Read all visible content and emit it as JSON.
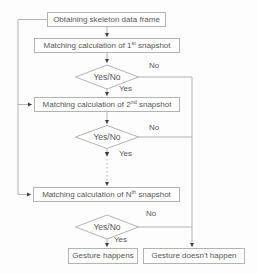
{
  "flowchart": {
    "nodes": {
      "start": {
        "label": "Obtaining skeleton data frame"
      },
      "match_1": {
        "text_before": "Matching calculation of 1",
        "superscript": "st",
        "text_after": " snapshot"
      },
      "decision_1": {
        "label": "Yes/No"
      },
      "match_2": {
        "text_before": "Matching calculation of 2",
        "superscript": "nd",
        "text_after": " snapshot"
      },
      "decision_2": {
        "label": "Yes/No"
      },
      "match_n": {
        "text_before": "Matching calculation of N",
        "superscript": "th",
        "text_after": " snapshot"
      },
      "decision_3": {
        "label": "Yes/No"
      },
      "gesture_happens": {
        "label": "Gesture happens"
      },
      "gesture_doesnt_happen": {
        "label": "Gesture doesn't happen"
      }
    },
    "edge_labels": {
      "decision_1_yes": "Yes",
      "decision_1_no": "No",
      "decision_2_yes": "Yes",
      "decision_2_no": "No",
      "decision_3_yes": "Yes",
      "decision_3_no": "No"
    },
    "colors": {
      "background": "#fdfdfd",
      "box_fill": "#ffffff",
      "box_border": "#b3b3b3",
      "line": "#b3b3b3",
      "text": "#555555",
      "arrowhead": "#3f3f3f"
    }
  }
}
